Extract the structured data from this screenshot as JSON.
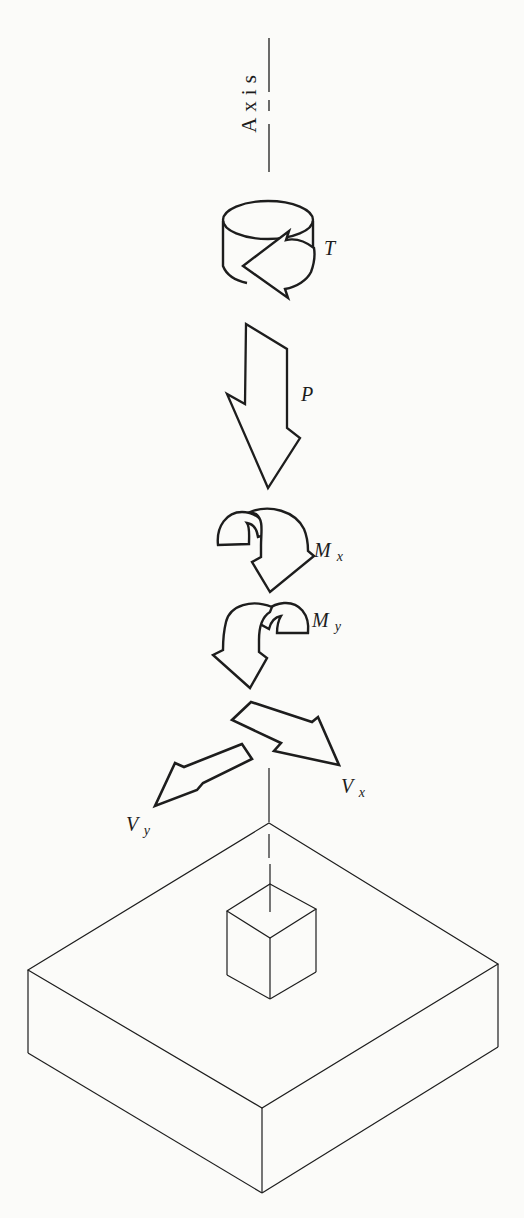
{
  "figure": {
    "background": "#fbfbf9",
    "ink": "#1d1d1d",
    "labels": {
      "axis": "Axis",
      "torque": "T",
      "axial_load": "P",
      "moment_x": {
        "base": "M",
        "sub": "x"
      },
      "moment_y": {
        "base": "M",
        "sub": "y"
      },
      "shear_x": {
        "base": "V",
        "sub": "x"
      },
      "shear_y": {
        "base": "V",
        "sub": "y"
      }
    },
    "parts": [
      "axis-line",
      "torque-arrow",
      "axial-force-arrow",
      "moment-x-arrow",
      "moment-y-arrow",
      "shear-x-arrow",
      "shear-y-arrow",
      "pedestal-cube",
      "footing-slab"
    ]
  }
}
